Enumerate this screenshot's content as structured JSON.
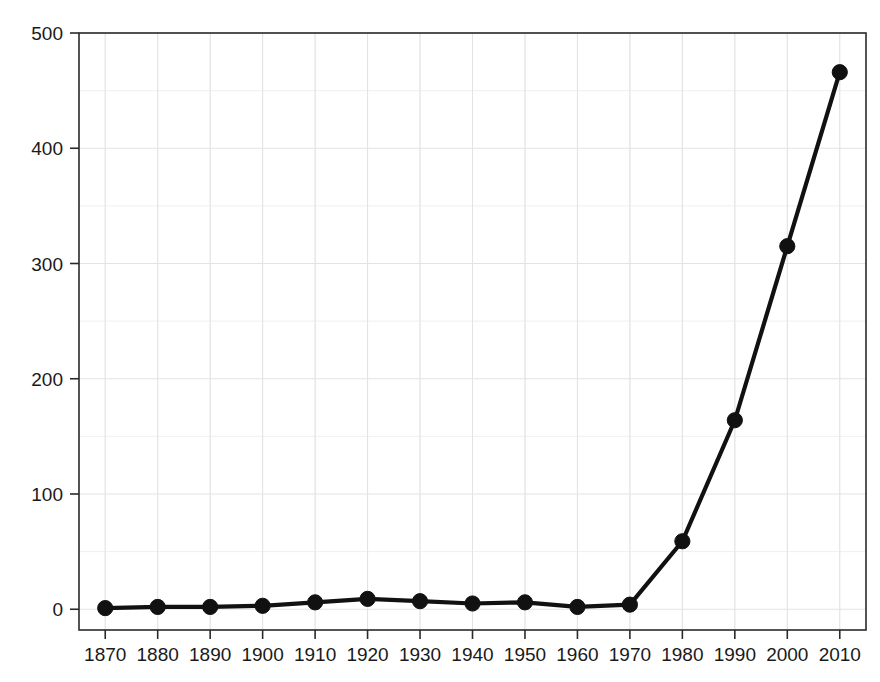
{
  "chart_data": {
    "type": "line",
    "title": "",
    "subtitle": "",
    "xlabel": "",
    "ylabel": "",
    "x": [
      1870,
      1880,
      1890,
      1900,
      1910,
      1920,
      1930,
      1940,
      1950,
      1960,
      1970,
      1980,
      1990,
      2000,
      2010
    ],
    "values": [
      1,
      2,
      2,
      3,
      6,
      9,
      7,
      5,
      6,
      2,
      4,
      59,
      164,
      315,
      466
    ],
    "series": [
      {
        "name": "",
        "values": [
          1,
          2,
          2,
          3,
          6,
          9,
          7,
          5,
          6,
          2,
          4,
          59,
          164,
          315,
          466
        ]
      }
    ],
    "x_tick_labels": [
      "1870",
      "1880",
      "1890",
      "1900",
      "1910",
      "1920",
      "1930",
      "1940",
      "1950",
      "1960",
      "1970",
      "1980",
      "1990",
      "2000",
      "2010"
    ],
    "y_tick_labels": [
      "0",
      "100",
      "200",
      "300",
      "400",
      "500"
    ],
    "y_ticks": [
      0,
      100,
      200,
      300,
      400,
      500
    ],
    "xlim": [
      1865,
      2015
    ],
    "ylim": [
      -18,
      500
    ],
    "grid": {
      "visible": true,
      "horizontal_step": 50,
      "vertical_step": 10,
      "major_color": "#e3e3e6",
      "minor_color": "#efeff1"
    },
    "legend": {
      "visible": false,
      "position": "none",
      "entries": []
    },
    "style": {
      "line_color": "#111111",
      "marker_color": "#111111",
      "marker_shape": "circle",
      "axis_color": "#2a2a2a",
      "background_color": "#ffffff",
      "text_color": "#1a1a1a"
    },
    "annotations": []
  }
}
